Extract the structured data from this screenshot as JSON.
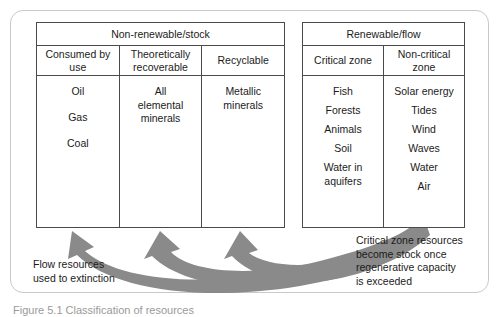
{
  "figure": {
    "caption": "Figure 5.1 Classification of resources",
    "frame_color": "#c9c9c9",
    "table_border_color": "#4a4a4a",
    "arrow_color": "#8a8a8a"
  },
  "tables": [
    {
      "id": "non-renewable",
      "title": "Non-renewable/stock",
      "columns": [
        {
          "header": "Consumed\nby use",
          "items": [
            "Oil",
            "Gas",
            "Coal"
          ]
        },
        {
          "header": "Theoretically\nrecoverable",
          "items": [
            "All\nelemental\nminerals"
          ]
        },
        {
          "header": "Recyclable",
          "items": [
            "Metallic\nminerals"
          ]
        }
      ]
    },
    {
      "id": "renewable",
      "title": "Renewable/flow",
      "columns": [
        {
          "header": "Critical zone",
          "items": [
            "Fish",
            "Forests",
            "Animals",
            "Soil",
            "Water in\naquifers"
          ]
        },
        {
          "header": "Non-critical\nzone",
          "items": [
            "Solar energy",
            "Tides",
            "Wind",
            "Waves",
            "Water",
            "Air"
          ]
        }
      ]
    }
  ],
  "annotations": {
    "flow_resources": "Flow resources\nused to extinction",
    "critical_zone": "Critical zone resources\nbecome stock once\nregenerative capacity\nis exceeded"
  },
  "arrows": {
    "count": 3,
    "description": "curved arrows from renewable table sweeping left into non-renewable columns",
    "targets": [
      "Consumed by use",
      "Theoretically recoverable",
      "Recyclable"
    ]
  }
}
